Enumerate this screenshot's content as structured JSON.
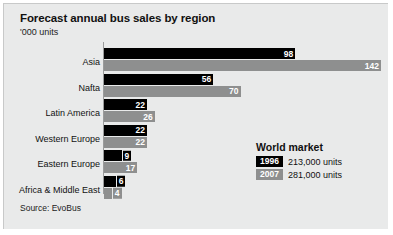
{
  "chart_data": {
    "type": "bar",
    "title": "Forecast annual bus sales by region",
    "subtitle": "'000 units",
    "xlabel": "",
    "ylabel": "",
    "unit_note": "'000 units",
    "orientation": "horizontal",
    "grid": false,
    "legend_position": "inside-right",
    "xlim": [
      0,
      142
    ],
    "categories": [
      "Asia",
      "Nafta",
      "Latin America",
      "Western Europe",
      "Eastern Europe",
      "Africa & Middle East"
    ],
    "series": [
      {
        "name": "1996",
        "color": "#000000",
        "values": [
          98,
          56,
          22,
          22,
          9,
          6
        ]
      },
      {
        "name": "2007",
        "color": "#8e8f8f",
        "values": [
          142,
          70,
          26,
          22,
          17,
          4
        ]
      }
    ],
    "source": "Source: EvoBus"
  },
  "legend": {
    "title": "World market",
    "rows": [
      {
        "year": "1996",
        "value": "213,000 units"
      },
      {
        "year": "2007",
        "value": "281,000 units"
      }
    ]
  },
  "colors": {
    "panel_background": "#e9eaea",
    "series_1996": "#000000",
    "series_2007": "#8e8f8f",
    "axis": "#9a9b9b",
    "text": "#111111"
  }
}
